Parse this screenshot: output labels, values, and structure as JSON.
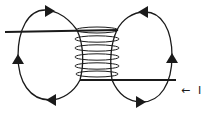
{
  "diagram": {
    "current_label": "I",
    "current_arrow": "←",
    "colors": {
      "stroke": "#1a1a1a",
      "background": "#ffffff"
    },
    "elements": {
      "top_wire": {
        "x1": 5,
        "y1": 32,
        "x2": 118,
        "y2": 30
      },
      "bottom_wire": {
        "x1": 80,
        "y1": 80,
        "x2": 176,
        "y2": 80
      },
      "coil_turns": 6,
      "left_loop": {
        "direction": "clockwise",
        "arrows": [
          "right",
          "up",
          "left"
        ]
      },
      "right_loop": {
        "direction": "counter-clockwise",
        "arrows": [
          "left",
          "up",
          "right"
        ]
      }
    }
  }
}
